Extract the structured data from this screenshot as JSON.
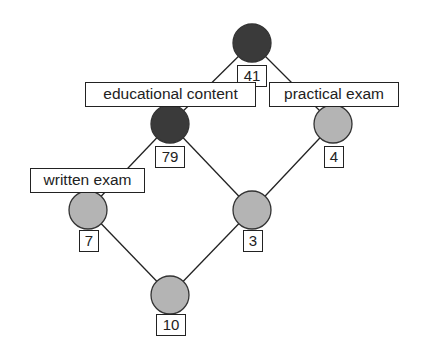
{
  "colors": {
    "dark_node": "#3a3a3a",
    "light_node": "#b4b4b4",
    "stroke": "#222222",
    "background": "#ffffff"
  },
  "nodes": [
    {
      "id": "top",
      "count": "41",
      "fill": "dark"
    },
    {
      "id": "educational",
      "count": "79",
      "fill": "dark"
    },
    {
      "id": "practical",
      "count": "4",
      "fill": "light"
    },
    {
      "id": "written",
      "count": "7",
      "fill": "light"
    },
    {
      "id": "middle",
      "count": "3",
      "fill": "light"
    },
    {
      "id": "bottom",
      "count": "10",
      "fill": "light"
    }
  ],
  "labels": {
    "educational": "educational content",
    "practical": "practical exam",
    "written": "written exam"
  },
  "edges": [
    [
      "top",
      "educational"
    ],
    [
      "top",
      "practical"
    ],
    [
      "educational",
      "written"
    ],
    [
      "educational",
      "middle"
    ],
    [
      "practical",
      "middle"
    ],
    [
      "written",
      "bottom"
    ],
    [
      "middle",
      "bottom"
    ]
  ]
}
